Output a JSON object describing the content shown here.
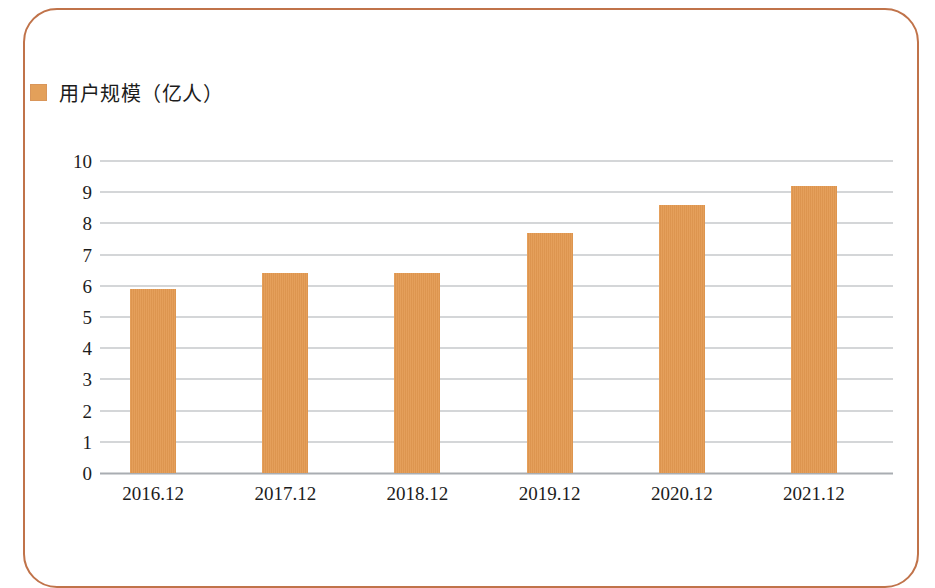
{
  "figure": {
    "border_color": "#c0734a",
    "background": "#ffffff"
  },
  "legend": {
    "swatch_color": "#e3a05a",
    "label": "用户规模（亿人）",
    "position": "top-left"
  },
  "chart_data": {
    "type": "bar",
    "title": "",
    "subtitle": "",
    "xlabel": "",
    "ylabel": "",
    "categories": [
      "2016.12",
      "2017.12",
      "2018.12",
      "2019.12",
      "2020.12",
      "2021.12"
    ],
    "series": [
      {
        "name": "用户规模（亿人）",
        "color": "#e49a52",
        "values": [
          5.9,
          6.4,
          6.4,
          7.7,
          8.6,
          9.2
        ]
      }
    ],
    "values": [
      5.9,
      6.4,
      6.4,
      7.7,
      8.6,
      9.2
    ],
    "ylim": [
      0,
      10
    ],
    "ytick_step": 1,
    "yticks": [
      10,
      9,
      8,
      7,
      6,
      5,
      4,
      3,
      2,
      1,
      0
    ],
    "ytick_labels": [
      "10",
      "9",
      "8",
      "7",
      "6",
      "5",
      "4",
      "3",
      "2",
      "1",
      "0"
    ],
    "grid": true,
    "grid_axis": "y",
    "grid_color": "#a9adb2",
    "legend": [
      "用户规模（亿人）"
    ],
    "legend_position": "top-left",
    "annotations": [],
    "data_labels": false,
    "unit": "亿人"
  }
}
